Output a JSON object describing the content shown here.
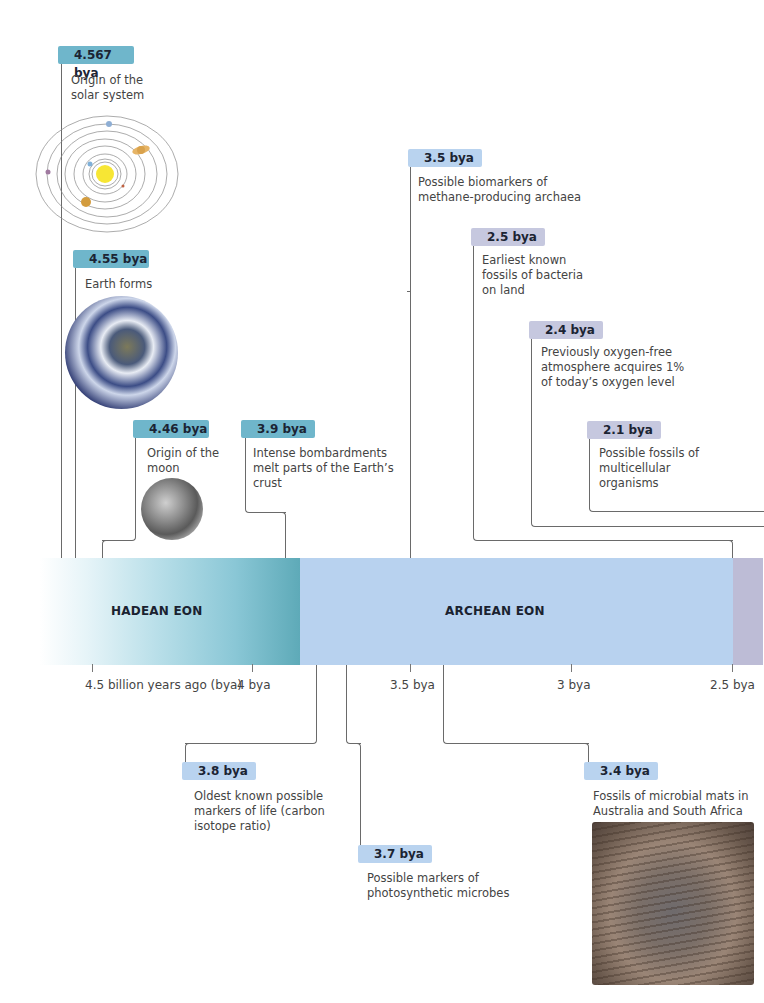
{
  "timeline": {
    "eons": [
      {
        "name": "HADEAN EON",
        "color_start": "#ffffff",
        "color_end": "#5eaab8"
      },
      {
        "name": "ARCHEAN EON",
        "color": "#b8d2ef"
      },
      {
        "name": "",
        "color": "#bdbcd6"
      }
    ],
    "axis_ticks": [
      {
        "label": "4.5 billion years ago (bya)"
      },
      {
        "label": "4 bya"
      },
      {
        "label": "3.5 bya"
      },
      {
        "label": "3 bya"
      },
      {
        "label": "2.5 bya"
      }
    ]
  },
  "events_above": [
    {
      "date": "4.567 bya",
      "text": "Origin of the\nsolar system",
      "image": "solar-system-diagram"
    },
    {
      "date": "4.55 bya",
      "text": "Earth forms",
      "image": "earth-photo"
    },
    {
      "date": "4.46 bya",
      "text": "Origin of the\nmoon",
      "image": "moon-photo"
    },
    {
      "date": "3.9 bya",
      "text": "Intense bombardments\nmelt parts of the Earth’s\ncrust"
    },
    {
      "date": "3.5 bya",
      "text": "Possible biomarkers of\nmethane-producing archaea"
    },
    {
      "date": "2.5 bya",
      "text": "Earliest known\nfossils of bacteria\non land"
    },
    {
      "date": "2.4 bya",
      "text": "Previously oxygen-free\natmosphere acquires 1%\nof today’s oxygen level"
    },
    {
      "date": "2.1 bya",
      "text": "Possible fossils of\nmulticellular\norganisms"
    }
  ],
  "events_below": [
    {
      "date": "3.8 bya",
      "text": "Oldest known possible\nmarkers of life (carbon\nisotope ratio)"
    },
    {
      "date": "3.7 bya",
      "text": "Possible markers of\nphotosynthetic microbes"
    },
    {
      "date": "3.4 bya",
      "text": "Fossils of microbial mats in\nAustralia and South Africa",
      "image": "microbial-mat-fossil-photo"
    }
  ],
  "colors": {
    "hadean_badge": "#6fb6cb",
    "archean_badge": "#b9d3ef",
    "proterozoic_badge": "#c6c8df",
    "connector_line": "#6a6a6a"
  }
}
